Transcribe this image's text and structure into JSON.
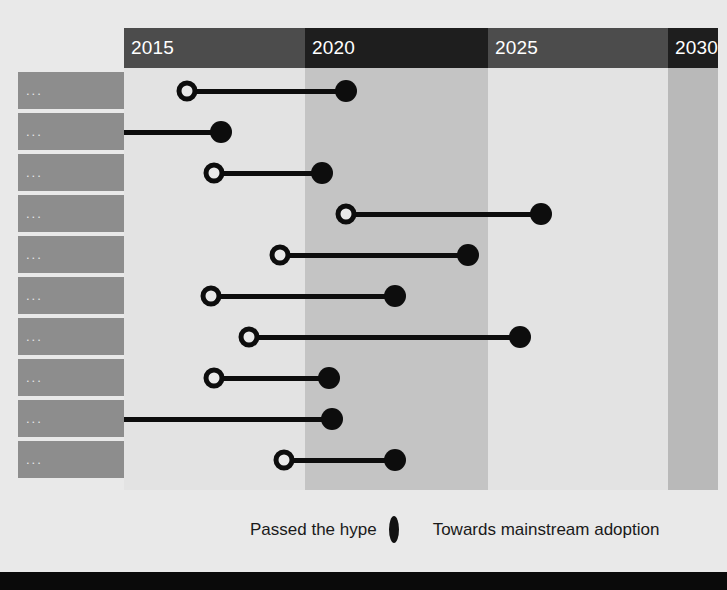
{
  "chart_data": {
    "type": "bar",
    "chart_style": "dumbbell-timeline",
    "title": "",
    "xlabel": "",
    "ylabel": "",
    "grid": false,
    "legend_position": "bottom-center",
    "axis": {
      "ticks": [
        "2015",
        "2020",
        "2025",
        "2030"
      ],
      "xlim": [
        2013.6,
        2030.7
      ],
      "band_shading": [
        "light",
        "dark",
        "light",
        "dark"
      ]
    },
    "legend": [
      {
        "label": "Passed the hype",
        "marker": "open-circle"
      },
      {
        "label": "Towards mainstream adoption",
        "marker": "filled-circle"
      }
    ],
    "categories": [
      "...",
      "...",
      "...",
      "...",
      "...",
      "...",
      "...",
      "...",
      "...",
      "..."
    ],
    "series": [
      {
        "name": "Passed the hype",
        "marker": "open-circle",
        "values": [
          2015.4,
          null,
          2016.2,
          2020.0,
          2018.1,
          2016.1,
          2017.2,
          2016.2,
          null,
          2018.2
        ]
      },
      {
        "name": "Towards mainstream adoption",
        "marker": "filled-circle",
        "values": [
          2020.0,
          2016.4,
          2019.3,
          2025.6,
          2023.5,
          2021.4,
          2025.0,
          2019.5,
          2019.6,
          2021.4
        ]
      }
    ],
    "rows": [
      {
        "label": "...",
        "start": 2015.4,
        "end": 2020.0,
        "start_marker": "open-circle",
        "end_marker": "filled-circle",
        "clipped_start": false
      },
      {
        "label": "...",
        "start": null,
        "end": 2016.4,
        "start_marker": "none",
        "end_marker": "filled-circle",
        "clipped_start": true
      },
      {
        "label": "...",
        "start": 2016.2,
        "end": 2019.3,
        "start_marker": "open-circle",
        "end_marker": "filled-circle",
        "clipped_start": false
      },
      {
        "label": "...",
        "start": 2020.0,
        "end": 2025.6,
        "start_marker": "open-circle",
        "end_marker": "filled-circle",
        "clipped_start": false
      },
      {
        "label": "...",
        "start": 2018.1,
        "end": 2023.5,
        "start_marker": "open-circle",
        "end_marker": "filled-circle",
        "clipped_start": false
      },
      {
        "label": "...",
        "start": 2016.1,
        "end": 2021.4,
        "start_marker": "open-circle",
        "end_marker": "filled-circle",
        "clipped_start": false
      },
      {
        "label": "...",
        "start": 2017.2,
        "end": 2025.0,
        "start_marker": "open-circle",
        "end_marker": "filled-circle",
        "clipped_start": false
      },
      {
        "label": "...",
        "start": 2016.2,
        "end": 2019.5,
        "start_marker": "open-circle",
        "end_marker": "filled-circle",
        "clipped_start": false
      },
      {
        "label": "...",
        "start": null,
        "end": 2019.6,
        "start_marker": "none",
        "end_marker": "filled-circle",
        "clipped_start": true
      },
      {
        "label": "...",
        "start": 2018.2,
        "end": 2021.4,
        "start_marker": "open-circle",
        "end_marker": "filled-circle",
        "clipped_start": false
      }
    ]
  },
  "header": {
    "years": [
      "2015",
      "2020",
      "2025",
      "2030"
    ]
  },
  "legend": {
    "passed_label": "Passed the hype",
    "mainstream_label": "Towards mainstream adoption"
  },
  "footer": {
    "text": ""
  },
  "colors": {
    "page_background": "#e9e9e9",
    "band_light": "#e3e3e3",
    "band_dark": "#c4c4c4",
    "band_edge": "#b9b9b9",
    "header_light": "#4c4c4c",
    "header_dark": "#1e1e1e",
    "row_label_bg": "#8d8d8d",
    "marker": "#0d0d0d",
    "footer_bg": "#0a0a0a"
  }
}
